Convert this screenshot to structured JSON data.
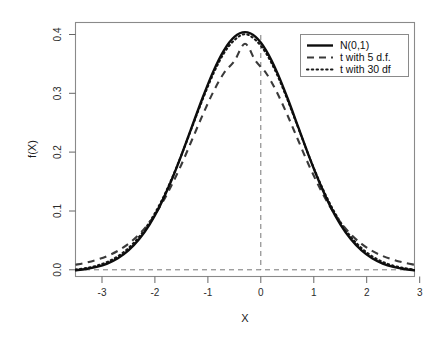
{
  "chart_data": {
    "type": "line",
    "title": "",
    "subtitle": "",
    "xlabel": "X",
    "ylabel": "f(X)",
    "xlim": [
      -3.2,
      3.2
    ],
    "ylim": [
      -0.008,
      0.415
    ],
    "grid": false,
    "legend_position": "top-right",
    "x_ticks": [
      "-3",
      "-2",
      "-1",
      "0",
      "1",
      "2",
      "3"
    ],
    "x_tick_values": [
      -3,
      -2,
      -1,
      0,
      1,
      2,
      3
    ],
    "y_ticks": [
      "0.0",
      "0.1",
      "0.2",
      "0.3",
      "0.4"
    ],
    "y_tick_values": [
      0.0,
      0.1,
      0.2,
      0.3,
      0.4
    ],
    "annotations": [
      {
        "name": "vertical-reference-line",
        "x": 0,
        "style": "dashed",
        "from_y": 0.0,
        "to_y": 0.3989
      },
      {
        "name": "horizontal-reference-line",
        "y": 0,
        "style": "dashed",
        "from_x": -3.2,
        "to_x": 3.2
      }
    ],
    "x": [
      -3.2,
      -3.0,
      -2.8,
      -2.6,
      -2.4,
      -2.2,
      -2.0,
      -1.8,
      -1.6,
      -1.4,
      -1.2,
      -1.0,
      -0.8,
      -0.6,
      -0.4,
      -0.2,
      0.0,
      0.2,
      0.4,
      0.6,
      0.8,
      1.0,
      1.2,
      1.4,
      1.6,
      1.8,
      2.0,
      2.2,
      2.4,
      2.6,
      2.8,
      3.0,
      3.2
    ],
    "series": [
      {
        "name": "N(0,1)",
        "style": "solid",
        "color": "#0d0d0d",
        "values": [
          0.0024,
          0.0044,
          0.0079,
          0.0136,
          0.0224,
          0.0355,
          0.054,
          0.079,
          0.1109,
          0.1497,
          0.1942,
          0.242,
          0.2897,
          0.3332,
          0.3683,
          0.391,
          0.3989,
          0.391,
          0.3683,
          0.3332,
          0.2897,
          0.242,
          0.1942,
          0.1497,
          0.1109,
          0.079,
          0.054,
          0.0355,
          0.0224,
          0.0136,
          0.0079,
          0.0044,
          0.0024
        ]
      },
      {
        "name": "t with 5 d.f.",
        "style": "dashed",
        "color": "#3a3a3a",
        "values": [
          0.0116,
          0.0151,
          0.0198,
          0.0261,
          0.0347,
          0.0464,
          0.062,
          0.0826,
          0.109,
          0.1414,
          0.1786,
          0.2197,
          0.2609,
          0.2992,
          0.3305,
          0.3509,
          0.3796,
          0.3509,
          0.3305,
          0.2992,
          0.2609,
          0.2197,
          0.1786,
          0.1414,
          0.109,
          0.0826,
          0.062,
          0.0464,
          0.0347,
          0.0261,
          0.0198,
          0.0151,
          0.0116
        ]
      },
      {
        "name": "t with 30 df",
        "style": "dotted",
        "color": "#1a1a1a",
        "values": [
          0.0036,
          0.006,
          0.01,
          0.0163,
          0.0257,
          0.0393,
          0.058,
          0.0828,
          0.1139,
          0.1514,
          0.1944,
          0.2407,
          0.2869,
          0.3292,
          0.3635,
          0.3857,
          0.3956,
          0.3857,
          0.3635,
          0.3292,
          0.2869,
          0.2407,
          0.1944,
          0.1514,
          0.1139,
          0.0828,
          0.058,
          0.0393,
          0.0257,
          0.0163,
          0.01,
          0.006,
          0.0036
        ]
      }
    ]
  },
  "legend": {
    "entries": [
      {
        "label": "N(0,1)",
        "key": "solid-line-key"
      },
      {
        "label": "t with 5 d.f.",
        "key": "dashed-line-key"
      },
      {
        "label": "t with 30 df",
        "key": "dotted-line-key"
      }
    ]
  },
  "axes": {
    "x_title": "X",
    "y_title": "f(X)",
    "x_tick_labels": [
      "-3",
      "-2",
      "-1",
      "0",
      "1",
      "2",
      "3"
    ],
    "y_tick_labels": [
      "0.0",
      "0.1",
      "0.2",
      "0.3",
      "0.4"
    ]
  }
}
